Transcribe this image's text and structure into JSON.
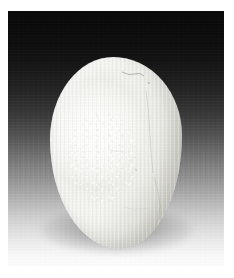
{
  "image": {
    "kind": "photograph",
    "subject": "smooth white ovoid stone",
    "orientation": "portrait",
    "canvas": {
      "width": 234,
      "height": 278
    },
    "frame": {
      "name": "white-mat-border",
      "left": 8,
      "top": 11,
      "width": 216,
      "height": 255,
      "mat_color": "#ffffff"
    },
    "background": {
      "name": "studio-gradient-backdrop",
      "type": "vertical-linear-gradient",
      "description": "near-black at top fading to white at bottom",
      "top_color": "#090909",
      "mid_color": "#585858",
      "bottom_color": "#fdfdfd",
      "texture": "fine vertical scan-line striations"
    },
    "subject_object": {
      "name": "stone",
      "shape": "ovoid / egg-shaped pebble",
      "surface": "smooth polished, matte white to cream",
      "base_color": "#f7f7f4",
      "highlight_color": "#ffffff",
      "shadow_side_color": "#c6c6bf",
      "bounds": {
        "left": 42,
        "top": 46,
        "width": 132,
        "height": 192
      },
      "highlight": {
        "name": "specular-highlight",
        "position": "upper-left of centre",
        "texture": "mottled speckled bloom"
      },
      "markings": [
        {
          "name": "vein-mark-top-right",
          "description": "faint dark hairline near the crown"
        },
        {
          "name": "vein-mark-right-flank",
          "description": "thin vertical crack line on the right shoulder"
        },
        {
          "name": "vein-mark-lower-right",
          "description": "short curved seam toward the lower right"
        }
      ]
    },
    "cast_shadow": {
      "name": "cast-shadow",
      "color": "#888888",
      "description": "soft elliptical shadow pooled beneath the stone base"
    }
  }
}
